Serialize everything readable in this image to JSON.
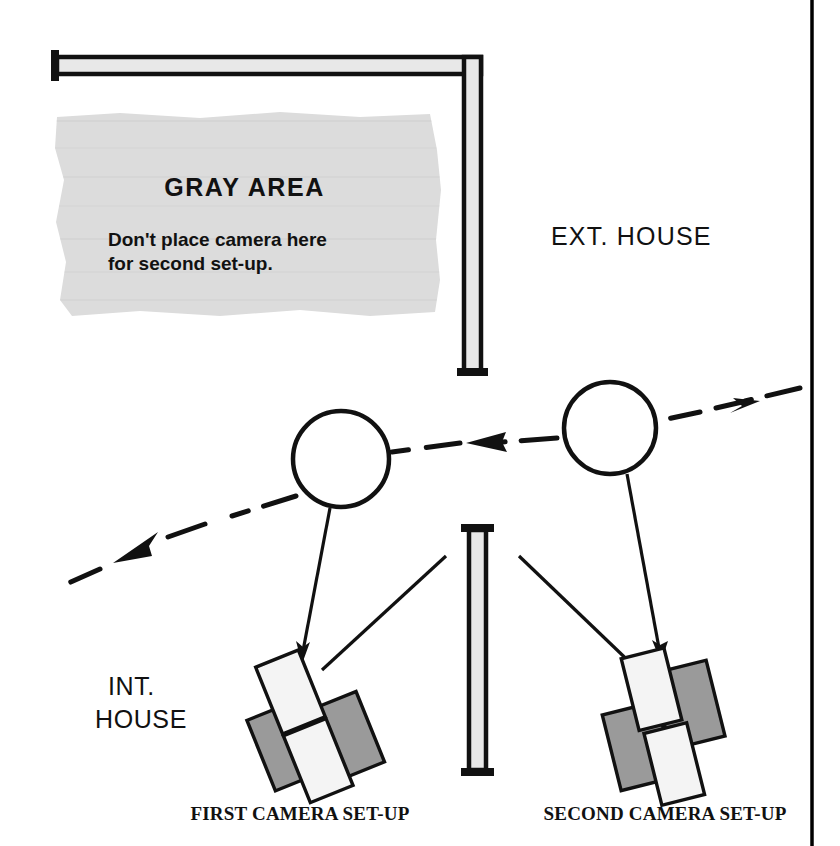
{
  "diagram": {
    "gray_area": {
      "heading": "GRAY AREA",
      "note_line_1": "Don't place camera here",
      "note_line_2": "for second set-up.",
      "fill_color": "#dcdcdc"
    },
    "labels": {
      "exterior": "EXT. HOUSE",
      "interior_line_1": "INT.",
      "interior_line_2": "HOUSE"
    },
    "captions": {
      "first_camera": "FIRST CAMERA SET-UP",
      "second_camera": "SECOND CAMERA SET-UP"
    },
    "colors": {
      "ink": "#111111",
      "wall_fill": "#e8e8e8",
      "camera_dark": "#9a9a9a",
      "camera_light": "#f4f4f4",
      "page_rule": "#000000"
    },
    "elements": {
      "wall_horizontal": "wall-horizontal",
      "wall_vertical": "wall-vertical",
      "wall_lower": "wall-lower",
      "actor_left": "actor-circle-left",
      "actor_right": "actor-circle-right",
      "camera_first": "camera-first",
      "camera_second": "camera-second",
      "eyeline_left": "dashed-eyeline-left",
      "eyeline_center": "dashed-eyeline-center",
      "eyeline_right": "dashed-eyeline-right",
      "page_border": "page-border-rule"
    }
  }
}
